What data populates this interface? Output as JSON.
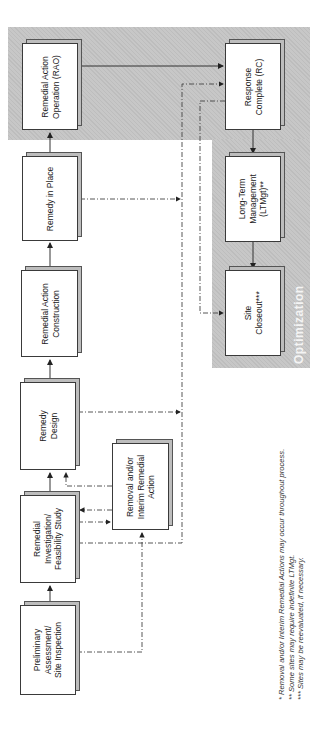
{
  "diagram": {
    "orientation": "rotated-90-ccw",
    "region_label": "Optimization",
    "region_color": "#c7c7c7",
    "nodes": [
      {
        "id": "pa_si",
        "label": "Preliminary\nAssessment/\nSite Inspection"
      },
      {
        "id": "ri_fs",
        "label": "Remedial\nInvestigation/\nFeasibility Study"
      },
      {
        "id": "rd",
        "label": "Remedy\nDesign"
      },
      {
        "id": "rac",
        "label": "Remedial Action\nConstruction"
      },
      {
        "id": "rip",
        "label": "Remedy in Place"
      },
      {
        "id": "rao",
        "label": "Remedial Action\nOperation (RAO)"
      },
      {
        "id": "removal",
        "label": "Removal and/or\nInterim Remedial\nAction"
      },
      {
        "id": "rc",
        "label": "Response\nComplete (RC)"
      },
      {
        "id": "ltm",
        "label": "Long-Term\nManagement\n(LTMgt)**"
      },
      {
        "id": "closeout",
        "label": "Site\nCloseout***"
      }
    ],
    "edges_solid": [
      [
        "pa_si",
        "ri_fs"
      ],
      [
        "ri_fs",
        "rd"
      ],
      [
        "rd",
        "rac"
      ],
      [
        "rac",
        "rip"
      ],
      [
        "rip",
        "rao"
      ],
      [
        "rao",
        "rc"
      ],
      [
        "rc",
        "ltm"
      ],
      [
        "ltm",
        "closeout"
      ]
    ],
    "edges_dashed": [
      [
        "pa_si",
        "removal"
      ],
      [
        "ri_fs",
        "removal"
      ],
      [
        "removal",
        "ri_fs"
      ],
      [
        "removal",
        "rd"
      ],
      [
        "ri_fs",
        "rc"
      ],
      [
        "rd",
        "rc"
      ],
      [
        "rip",
        "rc"
      ],
      [
        "rc",
        "closeout"
      ]
    ]
  },
  "footnotes": [
    "* Removal and/or Interim Remedial Actions may occur throughout process.",
    "** Some sites may require indefinite LTMgt.",
    "*** Sites may be reevaluated, if necessary."
  ]
}
